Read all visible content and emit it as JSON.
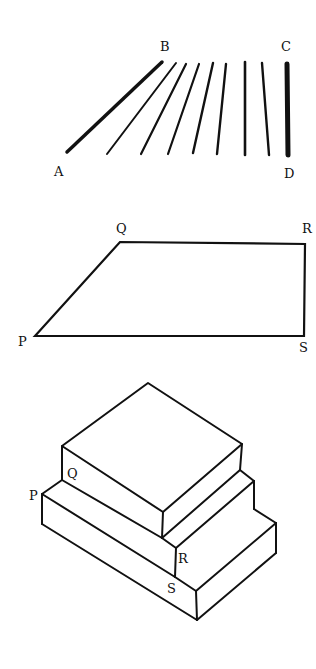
{
  "figure1": {
    "title": "Fan of lines from AB to CD",
    "labels": {
      "A": "A",
      "B": "B",
      "C": "C",
      "D": "D"
    },
    "lines": [
      {
        "x1": 67,
        "y1": 152,
        "x2": 162,
        "y2": 62,
        "w": 3.5
      },
      {
        "x1": 107,
        "y1": 154,
        "x2": 176,
        "y2": 63,
        "w": 2
      },
      {
        "x1": 141,
        "y1": 154,
        "x2": 186,
        "y2": 64,
        "w": 2.2
      },
      {
        "x1": 168,
        "y1": 154,
        "x2": 199,
        "y2": 64,
        "w": 2.2
      },
      {
        "x1": 193,
        "y1": 153,
        "x2": 213,
        "y2": 63,
        "w": 2.4
      },
      {
        "x1": 217,
        "y1": 154,
        "x2": 226,
        "y2": 64,
        "w": 2.4
      },
      {
        "x1": 245,
        "y1": 155,
        "x2": 245,
        "y2": 62,
        "w": 2.6
      },
      {
        "x1": 269,
        "y1": 155,
        "x2": 262,
        "y2": 63,
        "w": 2.4
      },
      {
        "x1": 288,
        "y1": 155,
        "x2": 287,
        "y2": 64,
        "w": 5
      }
    ]
  },
  "figure2": {
    "title": "Quadrilateral PQRS",
    "labels": {
      "P": "P",
      "Q": "Q",
      "R": "R",
      "S": "S"
    }
  },
  "figure3": {
    "title": "Stacked blocks with points P, Q, R, S",
    "labels": {
      "P": "P",
      "Q": "Q",
      "R": "R",
      "S": "S"
    }
  }
}
